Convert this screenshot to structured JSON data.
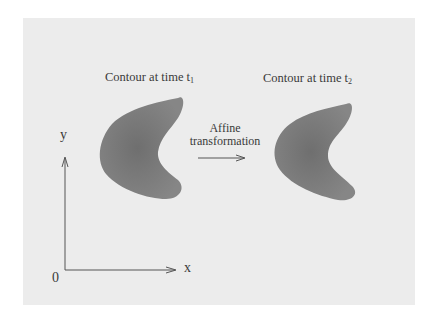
{
  "figure": {
    "contour1": {
      "label": "Contour at time t",
      "subscript": "1"
    },
    "contour2": {
      "label": "Contour at time t",
      "subscript": "2"
    },
    "transform": {
      "line1": "Affine",
      "line2": "transformation"
    },
    "axes": {
      "y_label": "y",
      "x_label": "x",
      "origin_label": "0"
    },
    "colors": {
      "background": "#ffffff",
      "panel": "#ececec",
      "shape_fill": "#7a7a7a",
      "line": "#555555",
      "text": "#3a3a3a"
    }
  }
}
